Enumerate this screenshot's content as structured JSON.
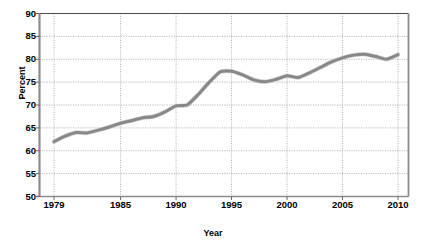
{
  "chart_data": {
    "type": "line",
    "title": "",
    "xlabel": "Year",
    "ylabel": "Percent",
    "xlim": [
      1979,
      2010
    ],
    "ylim": [
      50,
      90
    ],
    "ytick_values": [
      50,
      55,
      60,
      65,
      70,
      75,
      80,
      85,
      90
    ],
    "ytick_labels": [
      "50",
      "55",
      "60",
      "65",
      "70",
      "75",
      "80",
      "85",
      "90"
    ],
    "xtick_values": [
      1979,
      1985,
      1990,
      1995,
      2000,
      2005,
      2010
    ],
    "xtick_labels": [
      "1979",
      "1985",
      "1990",
      "1995",
      "2000",
      "2005",
      "2010"
    ],
    "grid": "dotted-both",
    "legend": "none",
    "line_color": "#888888",
    "line_width_px": 3,
    "axis_color": "#808080",
    "x": [
      1979,
      1980,
      1981,
      1982,
      1983,
      1984,
      1985,
      1986,
      1987,
      1988,
      1989,
      1990,
      1991,
      1992,
      1993,
      1994,
      1995,
      1996,
      1997,
      1998,
      1999,
      2000,
      2001,
      2002,
      2003,
      2004,
      2005,
      2006,
      2007,
      2008,
      2009,
      2010
    ],
    "values": [
      62.0,
      63.2,
      64.0,
      63.9,
      64.5,
      65.2,
      66.0,
      66.6,
      67.2,
      67.5,
      68.5,
      69.8,
      70.0,
      72.3,
      75.0,
      77.3,
      77.4,
      76.6,
      75.5,
      75.1,
      75.6,
      76.4,
      76.0,
      77.0,
      78.2,
      79.4,
      80.3,
      80.9,
      81.1,
      80.6,
      80.0,
      81.0
    ]
  }
}
